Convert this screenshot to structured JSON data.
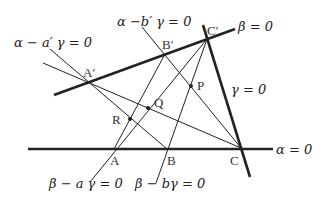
{
  "diagram": {
    "points": {
      "A": {
        "label": "A",
        "x": 114,
        "y": 149
      },
      "B": {
        "label": "B",
        "x": 167,
        "y": 149
      },
      "C": {
        "label": "C",
        "x": 241,
        "y": 148
      },
      "A_prime": {
        "label": "A′",
        "x": 89,
        "y": 83
      },
      "B_prime": {
        "label": "B′",
        "x": 165,
        "y": 54
      },
      "C_prime": {
        "label": "C′",
        "x": 207,
        "y": 39
      },
      "P": {
        "label": "P",
        "x": 191,
        "y": 86
      },
      "Q": {
        "label": "Q",
        "x": 148,
        "y": 108
      },
      "R": {
        "label": "R",
        "x": 130,
        "y": 119
      }
    },
    "lines": {
      "alpha": {
        "label": "α = 0"
      },
      "beta": {
        "label": "β = 0"
      },
      "gamma": {
        "label": "γ = 0"
      },
      "alpha_a_prime_gamma": {
        "label": "α − a′ γ = 0"
      },
      "alpha_b_prime_gamma": {
        "label": "α −b′ γ = 0"
      },
      "beta_a_gamma": {
        "label": "β − a γ = 0"
      },
      "beta_b_gamma": {
        "label": "β − bγ = 0"
      }
    },
    "colors": {
      "line": "#222222",
      "background": "#ffffff"
    }
  }
}
